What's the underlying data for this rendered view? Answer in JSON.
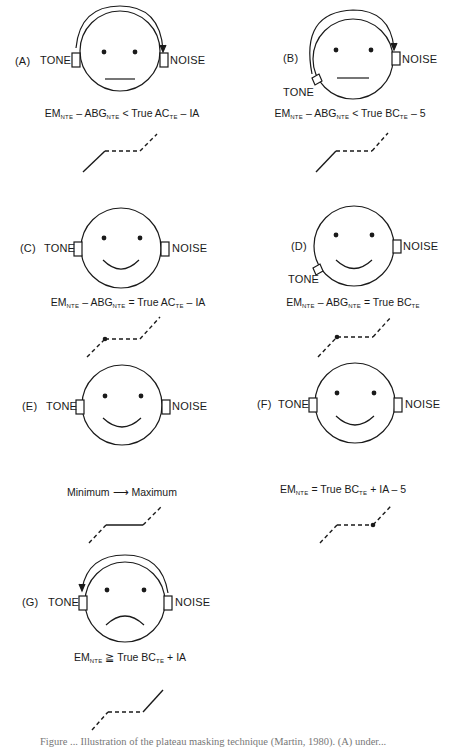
{
  "figure": {
    "panels": [
      {
        "id": "A",
        "label": "(A)",
        "tone_label": "TONE",
        "noise_label": "NOISE",
        "tone_position": "left-ear",
        "mouth": "flat",
        "crossover_arrow": "tone-to-noise",
        "formula": {
          "parts": [
            "EM",
            "NTE",
            " – ABG",
            "NTE",
            " < True AC",
            "TE",
            " – IA"
          ]
        },
        "plateau_graph": {
          "left_segment": "solid",
          "plateau": "dashed",
          "right_segment": "dashed",
          "marker": "none"
        }
      },
      {
        "id": "B",
        "label": "(B)",
        "tone_label": "TONE",
        "noise_label": "NOISE",
        "tone_position": "bone-vibrator-lower-left",
        "mouth": "flat",
        "crossover_arrow": "tone-to-noise",
        "formula": {
          "parts": [
            "EM",
            "NTE",
            " – ABG",
            "NTE",
            " < True BC",
            "TE",
            " – 5"
          ]
        },
        "plateau_graph": {
          "left_segment": "solid",
          "plateau": "dashed",
          "right_segment": "dashed",
          "marker": "none"
        }
      },
      {
        "id": "C",
        "label": "(C)",
        "tone_label": "TONE",
        "noise_label": "NOISE",
        "tone_position": "left-ear",
        "mouth": "smile",
        "crossover_arrow": "none",
        "formula": {
          "parts": [
            "EM",
            "NTE",
            " – ABG",
            "NTE",
            " = True AC",
            "TE",
            " – IA"
          ]
        },
        "plateau_graph": {
          "left_segment": "dashed",
          "plateau": "dashed",
          "right_segment": "dashed",
          "marker": "left-corner"
        }
      },
      {
        "id": "D",
        "label": "(D)",
        "tone_label": "TONE",
        "noise_label": "NOISE",
        "tone_position": "bone-vibrator-lower-left",
        "mouth": "smile",
        "crossover_arrow": "none",
        "formula": {
          "parts": [
            "EM",
            "NTE",
            " – ABG",
            "NTE",
            " = True BC",
            "TE",
            ""
          ]
        },
        "plateau_graph": {
          "left_segment": "dashed",
          "plateau": "dashed",
          "right_segment": "dashed",
          "marker": "left-corner"
        }
      },
      {
        "id": "E",
        "label": "(E)",
        "tone_label": "TONE",
        "noise_label": "NOISE",
        "tone_position": "left-ear",
        "mouth": "smile",
        "crossover_arrow": "none",
        "formula": {
          "text": "Minimum ⟶ Maximum"
        },
        "plateau_graph": {
          "left_segment": "dashed",
          "plateau": "solid",
          "right_segment": "dashed",
          "marker": "none"
        }
      },
      {
        "id": "F",
        "label": "(F)",
        "tone_label": "TONE",
        "noise_label": "NOISE",
        "tone_position": "left-ear",
        "mouth": "smile",
        "crossover_arrow": "none",
        "formula": {
          "parts": [
            "EM",
            "NTE",
            " = True BC",
            "TE",
            " + IA – 5"
          ]
        },
        "plateau_graph": {
          "left_segment": "dashed",
          "plateau": "dashed",
          "right_segment": "dashed",
          "marker": "right-corner"
        }
      },
      {
        "id": "G",
        "label": "(G)",
        "tone_label": "TONE",
        "noise_label": "NOISE",
        "tone_position": "left-ear",
        "mouth": "frown",
        "crossover_arrow": "noise-to-tone",
        "formula": {
          "parts": [
            "EM",
            "NTE",
            " ≧ True BC",
            "TE",
            " + IA"
          ]
        },
        "plateau_graph": {
          "left_segment": "dashed",
          "plateau": "dashed",
          "right_segment": "solid",
          "marker": "none"
        }
      }
    ],
    "caption_partial": "Figure ... Illustration of the plateau masking technique (Martin, 1980). (A) under..."
  },
  "colors": {
    "ink": "#1a1a1a",
    "background": "#ffffff",
    "caption": "#777777"
  }
}
